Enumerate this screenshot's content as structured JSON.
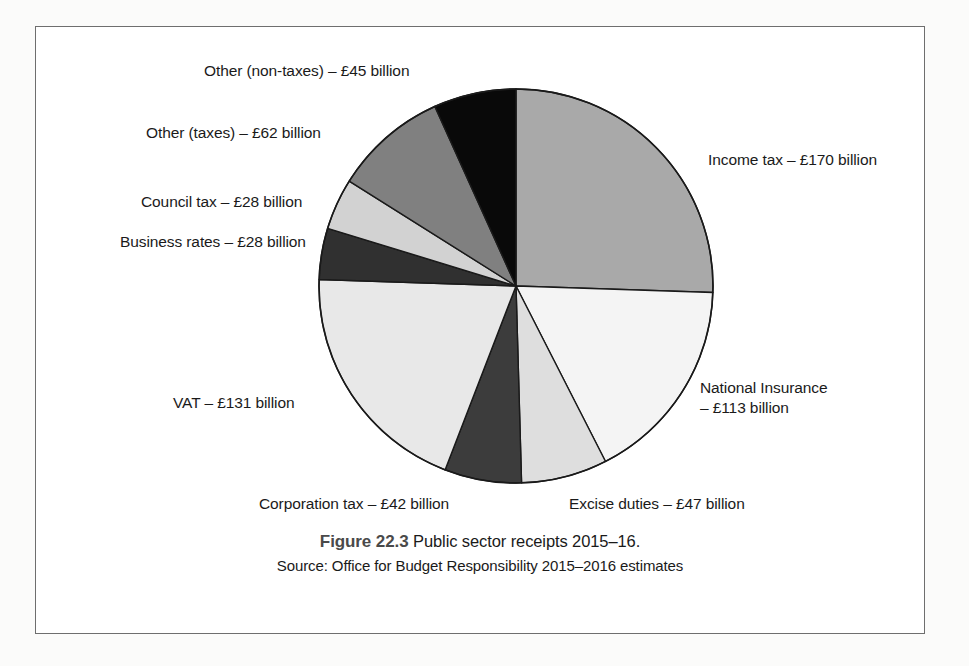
{
  "figure": {
    "number_label": "Figure 22.3",
    "title": "Public sector receipts 2015–16.",
    "source": "Source: Office for Budget Responsibility 2015–2016 estimates"
  },
  "labels": {
    "income_tax": "Income tax – £170 billion",
    "national_insurance_line1": "National Insurance",
    "national_insurance_line2": "– £113 billion",
    "excise_duties": "Excise duties – £47 billion",
    "corporation_tax": "Corporation tax – £42 billion",
    "vat": "VAT – £131 billion",
    "business_rates": "Business rates – £28 billion",
    "council_tax": "Council tax – £28 billion",
    "other_taxes": "Other (taxes) – £62 billion",
    "other_non_taxes": "Other (non-taxes) – £45 billion"
  },
  "chart_data": {
    "type": "pie",
    "title": "Public sector receipts 2015–16",
    "unit": "£ billion",
    "total": 666,
    "start_angle_deg": 0,
    "direction": "clockwise",
    "grid": false,
    "legend": "none (direct labels with leader placement)",
    "categories": [
      "Income tax",
      "National Insurance",
      "Excise duties",
      "Corporation tax",
      "VAT",
      "Business rates",
      "Council tax",
      "Other (taxes)",
      "Other (non-taxes)"
    ],
    "values": [
      170,
      113,
      47,
      42,
      131,
      28,
      28,
      62,
      45
    ],
    "slices": [
      {
        "label": "Income tax",
        "value": 170,
        "unit": "£ billion",
        "percent": 25.5,
        "color": "#a9a9a9"
      },
      {
        "label": "National Insurance",
        "value": 113,
        "unit": "£ billion",
        "percent": 17.0,
        "color": "#f4f4f4"
      },
      {
        "label": "Excise duties",
        "value": 47,
        "unit": "£ billion",
        "percent": 7.1,
        "color": "#dedede"
      },
      {
        "label": "Corporation tax",
        "value": 42,
        "unit": "£ billion",
        "percent": 6.3,
        "color": "#3c3c3c"
      },
      {
        "label": "VAT",
        "value": 131,
        "unit": "£ billion",
        "percent": 19.7,
        "color": "#e8e8e8"
      },
      {
        "label": "Business rates",
        "value": 28,
        "unit": "£ billion",
        "percent": 4.2,
        "color": "#303030"
      },
      {
        "label": "Council tax",
        "value": 28,
        "unit": "£ billion",
        "percent": 4.2,
        "color": "#d2d2d2"
      },
      {
        "label": "Other (taxes)",
        "value": 62,
        "unit": "£ billion",
        "percent": 9.3,
        "color": "#808080"
      },
      {
        "label": "Other (non-taxes)",
        "value": 45,
        "unit": "£ billion",
        "percent": 6.8,
        "color": "#090909"
      }
    ]
  },
  "style": {
    "frame_border": "#6e6e6e",
    "slice_outline": "#1a1a1a",
    "page_background": "#fbfbfa"
  }
}
